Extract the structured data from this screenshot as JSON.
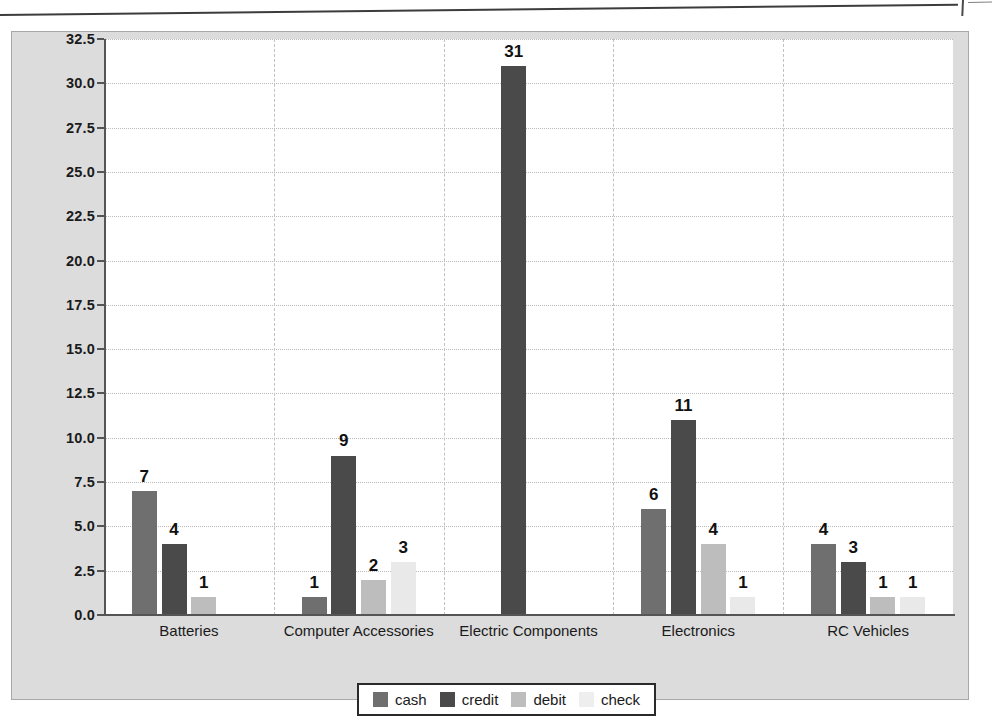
{
  "scan": {
    "edge_note": "page-edge-artifact"
  },
  "chart_data": {
    "type": "bar",
    "title": "",
    "subtitle": "",
    "xlabel": "",
    "ylabel": "",
    "grid": true,
    "legend_position": "bottom",
    "ylim": [
      0.0,
      32.5
    ],
    "ytick_step": 2.5,
    "ytick_labels": [
      "0.0",
      "2.5",
      "5.0",
      "7.5",
      "10.0",
      "12.5",
      "15.0",
      "17.5",
      "20.0",
      "22.5",
      "25.0",
      "27.5",
      "30.0",
      "32.5"
    ],
    "ytick_values": [
      0.0,
      2.5,
      5.0,
      7.5,
      10.0,
      12.5,
      15.0,
      17.5,
      20.0,
      22.5,
      25.0,
      27.5,
      30.0,
      32.5
    ],
    "categories": [
      "Batteries",
      "Computer Accessories",
      "Electric Components",
      "Electronics",
      "RC Vehicles"
    ],
    "series": [
      {
        "name": "cash",
        "color": "#6f6f6f",
        "values": [
          7,
          1,
          null,
          6,
          4
        ]
      },
      {
        "name": "credit",
        "color": "#4a4a4a",
        "values": [
          4,
          9,
          31,
          11,
          3
        ]
      },
      {
        "name": "debit",
        "color": "#bdbdbd",
        "values": [
          1,
          2,
          null,
          4,
          1
        ]
      },
      {
        "name": "check",
        "color": "#e9e9e9",
        "values": [
          null,
          3,
          null,
          1,
          1
        ]
      }
    ],
    "point_labels": {
      "Batteries": {
        "cash": "7",
        "credit": "4",
        "debit": "1",
        "check": ""
      },
      "Computer Accessories": {
        "cash": "1",
        "credit": "9",
        "debit": "2",
        "check": "3"
      },
      "Electric Components": {
        "cash": "",
        "credit": "31",
        "debit": "",
        "check": ""
      },
      "Electronics": {
        "cash": "6",
        "credit": "11",
        "debit": "4",
        "check": "1"
      },
      "RC Vehicles": {
        "cash": "4",
        "credit": "3",
        "debit": "1",
        "check": "1"
      }
    }
  },
  "legend": {
    "items": [
      {
        "label": "cash",
        "key": "cash"
      },
      {
        "label": "credit",
        "key": "credit"
      },
      {
        "label": "debit",
        "key": "debit"
      },
      {
        "label": "check",
        "key": "check"
      }
    ]
  },
  "colors": {
    "panel_background": "#dcdcdc",
    "plot_background": "#ffffff",
    "axis": "#555555",
    "gridline": "#b9b9b9",
    "separator": "#c2c2c2",
    "text": "#1a1a1a"
  }
}
